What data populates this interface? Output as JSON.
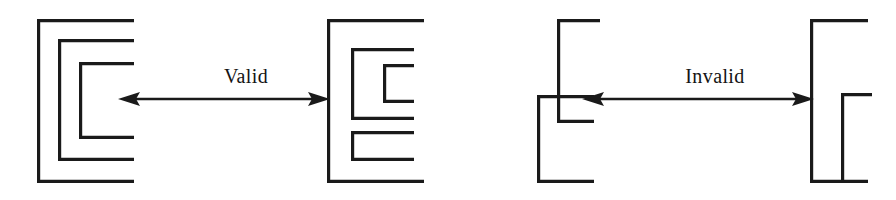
{
  "figure": {
    "canvas": {
      "width": 896,
      "height": 200,
      "background": "#ffffff"
    },
    "stroke_color": "#1a1a1a",
    "text_color": "#141414",
    "pairs": [
      {
        "id": "valid-pair",
        "label": "Valid",
        "label_name": "valid-label",
        "left_shape": {
          "name": "nested-comb-three-levels",
          "description": "Outer C bracket containing two concentric inner C brackets, all opening to the right",
          "brackets": [
            {
              "level": 1,
              "left": 37,
              "top": 19,
              "right": 134,
              "bottom": 183
            },
            {
              "level": 2,
              "left": 58,
              "top": 39,
              "right": 134,
              "bottom": 161
            },
            {
              "level": 3,
              "left": 79,
              "top": 62,
              "right": 134,
              "bottom": 139
            }
          ]
        },
        "right_shape": {
          "name": "comb-with-offset-teeth",
          "description": "Outer C bracket whose interior holds a medium C bracket (itself holding a small C) above a separate small C bracket",
          "brackets": [
            {
              "level": 1,
              "left": 327,
              "top": 19,
              "right": 424,
              "bottom": 183
            },
            {
              "level": 2,
              "left": 351,
              "top": 48,
              "right": 414,
              "bottom": 120
            },
            {
              "level": 3,
              "left": 383,
              "top": 64,
              "right": 414,
              "bottom": 103
            },
            {
              "level": 4,
              "left": 351,
              "top": 131,
              "right": 414,
              "bottom": 161
            }
          ]
        },
        "arrow": {
          "name": "valid-double-arrow",
          "x_start": 118,
          "x_end": 330,
          "y": 99,
          "heads": "both"
        }
      },
      {
        "id": "invalid-pair",
        "label": "Invalid",
        "label_name": "invalid-label",
        "left_shape": {
          "name": "crossing-comb-overlap",
          "description": "A tall C bracket crossing over a lower-left C bracket so the strokes intersect",
          "brackets": [
            {
              "level": 1,
              "left": 557,
              "top": 19,
              "right": 600,
              "bottom": 123
            },
            {
              "level": 2,
              "left": 537,
              "top": 95,
              "right": 594,
              "bottom": 183
            }
          ]
        },
        "right_shape": {
          "name": "comb-single-tooth",
          "description": "Outer C bracket containing one smaller C bracket aligned to its lower right",
          "brackets": [
            {
              "level": 1,
              "left": 810,
              "top": 19,
              "right": 868,
              "bottom": 183
            },
            {
              "level": 2,
              "left": 841,
              "top": 93,
              "right": 872,
              "bottom": 183
            }
          ]
        },
        "arrow": {
          "name": "invalid-double-arrow",
          "x_start": 582,
          "x_end": 814,
          "y": 99,
          "heads": "both"
        }
      }
    ]
  }
}
